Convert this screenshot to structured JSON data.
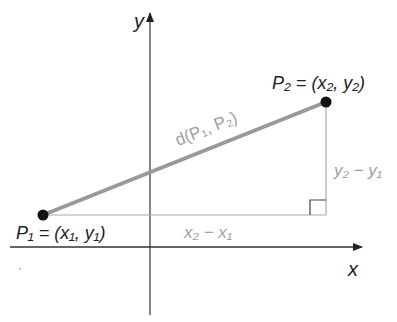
{
  "diagram": {
    "type": "distance-formula",
    "axes": {
      "x_label": "x",
      "y_label": "y"
    },
    "points": [
      {
        "id": "P1",
        "name": "P",
        "sub": "1",
        "coords_text": "(x₁, y₁)",
        "label": "P₁ = (x₁, y₁)"
      },
      {
        "id": "P2",
        "name": "P",
        "sub": "2",
        "coords_text": "(x₂, y₂)",
        "label": "P₂ = (x₂, y₂)"
      }
    ],
    "segments": {
      "hypotenuse_label": "d(P₁, P₂)",
      "horizontal_leg_label": "x₂ − x₁",
      "vertical_leg_label": "y₂ − y₁"
    },
    "colors": {
      "axis": "#333333",
      "point": "#111111",
      "hypotenuse": "#999999",
      "legs": "#aaaaaa",
      "leg_labels": "#a0a0a0",
      "right_angle_marker": "#444444",
      "text": "#222222"
    },
    "right_angle_marker": true
  }
}
